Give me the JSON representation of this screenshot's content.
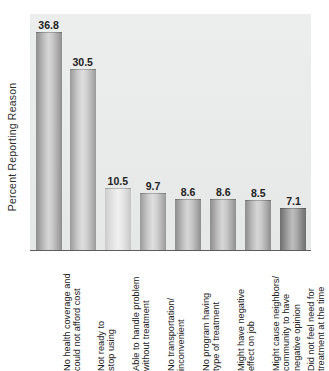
{
  "chart_data": {
    "type": "bar",
    "title": "",
    "xlabel": "",
    "ylabel": "Percent Reporting Reason",
    "ylim": [
      0,
      40
    ],
    "grid": false,
    "legend": false,
    "categories": [
      "No health coverage and\ncould not afford cost",
      "Not ready to\nstop using",
      "Able to handle problem\nwithout treatment",
      "No transportation/\ninconvenient",
      "No program having\ntype of treatment",
      "Might have negative\neffect on job",
      "Might cause neighbors/\ncommunity to have\nnegative opinion",
      "Did not feel need for\ntreatment at the time"
    ],
    "values": [
      36.8,
      30.5,
      10.5,
      9.7,
      8.6,
      8.6,
      8.5,
      7.1
    ],
    "value_labels": [
      "36.8",
      "30.5",
      "10.5",
      "9.7",
      "8.6",
      "8.6",
      "8.5",
      "7.1"
    ],
    "bar_shades": [
      "dark",
      "mid",
      "light",
      "mid",
      "dark",
      "dark",
      "dark",
      "deep"
    ],
    "colors": {
      "plot_background": "#eaebeb",
      "axis_line": "#5c5c5c",
      "text": "#222222",
      "page_background": "#ffffff"
    }
  }
}
